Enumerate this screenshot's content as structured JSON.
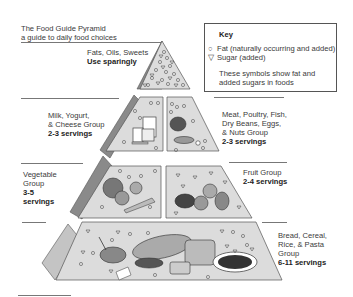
{
  "title": {
    "line1": "The Food Guide Pyramid",
    "line2": "a guide to daily food choices"
  },
  "key": {
    "heading": "Key",
    "items": [
      {
        "symbol": "○",
        "icon": "circle-fat-icon",
        "label": "Fat (naturally occurring and added)"
      },
      {
        "symbol": "▽",
        "icon": "triangle-sugar-icon",
        "label": "Sugar (added)"
      }
    ],
    "note_line1": "These symbols show fat and",
    "note_line2": "added sugars in foods"
  },
  "tiers": {
    "fats": {
      "name": "Fats, Oils, Sweets",
      "servings": "Use sparingly"
    },
    "milk": {
      "name_line1": "Milk, Yogurt,",
      "name_line2": "& Cheese Group",
      "servings": "2-3 servings"
    },
    "meat": {
      "name_line1": "Meat, Poultry, Fish,",
      "name_line2": "Dry Beans, Eggs,",
      "name_line3": "& Nuts Group",
      "servings": "2-3 servings"
    },
    "vegetable": {
      "name_line1": "Vegetable",
      "name_line2": "Group",
      "servings_line1": "3-5",
      "servings_line2": "servings"
    },
    "fruit": {
      "name": "Fruit Group",
      "servings": "2-4 servings"
    },
    "bread": {
      "name_line1": "Bread, Cereal,",
      "name_line2": "Rice, & Pasta",
      "name_line3": "Group",
      "servings": "6-11 servings"
    }
  },
  "colors": {
    "panel": "#dcdcdc",
    "side": "#8a8a8a",
    "side_light": "#c4c4c4",
    "outline": "#555555"
  }
}
